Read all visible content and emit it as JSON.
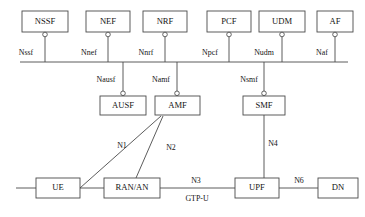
{
  "diagram": {
    "caption": "",
    "colors": {
      "stroke": "#4a4a4a",
      "box_fill": "#ffffff",
      "text": "#141414",
      "background": "#ffffff"
    },
    "bus": {
      "name": "service-based-interface-bus",
      "x1": 20,
      "x2": 348,
      "y": 62
    },
    "top_row_nodes": [
      {
        "id": "nssf",
        "label": "NSSF",
        "x": 22,
        "y": 11,
        "w": 46,
        "h": 21,
        "interface": "Nssf",
        "interface_label": "Nssf",
        "interface_label_x": 26,
        "stub_x": 45
      },
      {
        "id": "nef",
        "label": "NEF",
        "x": 86,
        "y": 11,
        "w": 44,
        "h": 21,
        "interface": "Nnef",
        "interface_label": "Nnef",
        "interface_label_x": 88,
        "stub_x": 108
      },
      {
        "id": "nrf",
        "label": "NRF",
        "x": 143,
        "y": 11,
        "w": 44,
        "h": 21,
        "interface": "Nnrf",
        "interface_label": "Nnrf",
        "interface_label_x": 144,
        "stub_x": 165
      },
      {
        "id": "pcf",
        "label": "PCF",
        "x": 207,
        "y": 11,
        "w": 44,
        "h": 21,
        "interface": "Npcf",
        "interface_label": "Npcf",
        "interface_label_x": 208,
        "stub_x": 229
      },
      {
        "id": "udm",
        "label": "UDM",
        "x": 259,
        "y": 11,
        "w": 46,
        "h": 21,
        "interface": "Nudm",
        "interface_label": "Nudm",
        "interface_label_x": 262,
        "stub_x": 282
      },
      {
        "id": "af",
        "label": "AF",
        "x": 317,
        "y": 11,
        "w": 36,
        "h": 21,
        "interface": "Naf",
        "interface_label": "Naf",
        "interface_label_x": 320,
        "stub_x": 335
      }
    ],
    "second_row_nodes": [
      {
        "id": "ausf",
        "label": "AUSF",
        "x": 100,
        "y": 96,
        "w": 46,
        "h": 19,
        "interface": "Nausf",
        "interface_label": "Nausf",
        "interface_label_x": 104,
        "stub_x": 123
      },
      {
        "id": "amf",
        "label": "AMF",
        "x": 155,
        "y": 96,
        "w": 45,
        "h": 19,
        "interface": "Namf",
        "interface_label": "Namf",
        "interface_label_x": 159,
        "stub_x": 177
      },
      {
        "id": "smf",
        "label": "SMF",
        "x": 243,
        "y": 96,
        "w": 42,
        "h": 19,
        "interface": "Nsmf",
        "interface_label": "Nsmf",
        "interface_label_x": 247,
        "stub_x": 264
      }
    ],
    "bottom_row_nodes": [
      {
        "id": "ue",
        "label": "UE",
        "x": 36,
        "y": 178,
        "w": 44,
        "h": 20
      },
      {
        "id": "ran_an",
        "label": "RAN/AN",
        "x": 104,
        "y": 178,
        "w": 56,
        "h": 20
      },
      {
        "id": "upf",
        "label": "UPF",
        "x": 235,
        "y": 178,
        "w": 44,
        "h": 20
      },
      {
        "id": "dn",
        "label": "DN",
        "x": 318,
        "y": 178,
        "w": 40,
        "h": 20
      }
    ],
    "reference_points": [
      {
        "id": "n1",
        "label": "N1",
        "x": 122,
        "y": 146
      },
      {
        "id": "n2",
        "label": "N2",
        "x": 170,
        "y": 148
      },
      {
        "id": "n3",
        "label": "N3",
        "x": 195,
        "y": 181
      },
      {
        "id": "gtpu",
        "label": "GTP-U",
        "x": 196,
        "y": 199
      },
      {
        "id": "n4",
        "label": "N4",
        "x": 272,
        "y": 144
      },
      {
        "id": "n6",
        "label": "N6",
        "x": 299,
        "y": 181
      }
    ],
    "edges": [
      {
        "id": "ue-tail",
        "from": "left-stub",
        "to": "ue",
        "type": "horizontal"
      },
      {
        "id": "ue-ran",
        "from": "ue",
        "to": "ran_an",
        "type": "horizontal"
      },
      {
        "id": "ran-upf",
        "from": "ran_an",
        "to": "upf",
        "type": "horizontal",
        "label": "N3"
      },
      {
        "id": "upf-dn",
        "from": "upf",
        "to": "dn",
        "type": "horizontal",
        "label": "N6"
      },
      {
        "id": "ue-amf",
        "from": "ue",
        "to": "amf",
        "type": "diagonal",
        "label": "N1"
      },
      {
        "id": "ran-amf",
        "from": "ran_an",
        "to": "amf",
        "type": "diagonal",
        "label": "N2"
      },
      {
        "id": "smf-upf",
        "from": "smf",
        "to": "upf",
        "type": "vertical",
        "label": "N4"
      }
    ]
  }
}
